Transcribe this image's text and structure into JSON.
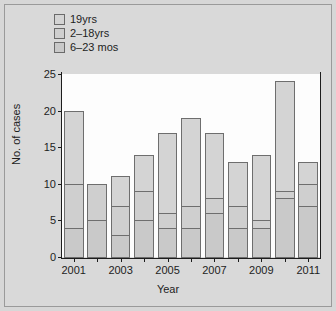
{
  "chart_data": {
    "type": "bar",
    "subtype": "stacked-bar",
    "title": "",
    "xlabel": "Year",
    "ylabel": "No. of cases",
    "categories": [
      "2001",
      "2002",
      "2003",
      "2004",
      "2005",
      "2006",
      "2007",
      "2008",
      "2009",
      "2010",
      "2011"
    ],
    "xtick_labels": [
      "2001",
      "2003",
      "2005",
      "2007",
      "2009",
      "2011"
    ],
    "ytick_labels": [
      "0",
      "5",
      "10",
      "15",
      "20",
      "25"
    ],
    "ytick_values": [
      0,
      5,
      10,
      15,
      20,
      25
    ],
    "ylim": [
      0,
      25
    ],
    "grid": false,
    "legend_position": "top-left",
    "series": [
      {
        "name": "6–23 mos",
        "color": "#c9c9c9",
        "values": [
          4,
          5,
          3,
          5,
          4,
          4,
          6,
          4,
          4,
          8,
          7
        ]
      },
      {
        "name": "2–18yrs",
        "color": "#cfcfcf",
        "values": [
          6,
          5,
          4,
          4,
          2,
          3,
          2,
          3,
          1,
          1,
          3
        ]
      },
      {
        "name": "19yrs",
        "color": "#d4d4d4",
        "values": [
          10,
          0,
          4,
          5,
          11,
          12,
          9,
          6,
          9,
          15,
          3
        ]
      }
    ],
    "totals": [
      20,
      10,
      11,
      14,
      17,
      19,
      17,
      13,
      14,
      24,
      13
    ]
  },
  "legend": {
    "items": [
      {
        "label": "19yrs",
        "swatch": "#d4d4d4"
      },
      {
        "label": "2–18yrs",
        "swatch": "#cfcfcf"
      },
      {
        "label": "6–23 mos",
        "swatch": "#c9c9c9"
      }
    ]
  },
  "axes": {
    "y_title": "No. of cases",
    "x_title": "Year"
  },
  "colors": {
    "page_background": "#d7d7d7",
    "plot_background": "#fdfdfd",
    "axis": "#1d1d1d",
    "bar_outline": "#6e6e6e"
  }
}
